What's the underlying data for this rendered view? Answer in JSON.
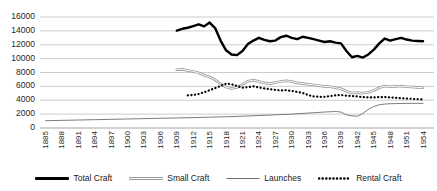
{
  "chart_data": {
    "type": "line",
    "title": "",
    "xlabel": "",
    "ylabel": "",
    "ylim": [
      0,
      16000
    ],
    "ytick_values": [
      0,
      2000,
      4000,
      6000,
      8000,
      10000,
      12000,
      14000,
      16000
    ],
    "ytick_labels": [
      "0",
      "2000",
      "4000",
      "6000",
      "8000",
      "10000",
      "12000",
      "14000",
      "16000"
    ],
    "grid": true,
    "legend_position": "bottom",
    "x_start": 1884,
    "x_end": 1956,
    "categories": [
      1885,
      1888,
      1891,
      1894,
      1897,
      1900,
      1903,
      1906,
      1909,
      1912,
      1915,
      1918,
      1921,
      1924,
      1927,
      1930,
      1933,
      1936,
      1939,
      1942,
      1945,
      1948,
      1951,
      1954
    ],
    "xtick_labels": [
      "1885",
      "1888",
      "1891",
      "1894",
      "1897",
      "1900",
      "1903",
      "1906",
      "1909",
      "1912",
      "1915",
      "1918",
      "1921",
      "1924",
      "1927",
      "1930",
      "1933",
      "1936",
      "1939",
      "1942",
      "1945",
      "1948",
      "1951",
      "1954"
    ],
    "series": [
      {
        "name": "Total Craft",
        "style": "thick-solid",
        "color": "#000000",
        "x": [
          1909,
          1910,
          1911,
          1912,
          1913,
          1914,
          1915,
          1916,
          1917,
          1918,
          1919,
          1920,
          1921,
          1922,
          1923,
          1924,
          1925,
          1926,
          1927,
          1928,
          1929,
          1930,
          1931,
          1932,
          1933,
          1934,
          1935,
          1936,
          1937,
          1938,
          1939,
          1940,
          1941,
          1942,
          1943,
          1944,
          1945,
          1946,
          1947,
          1948,
          1949,
          1950,
          1951,
          1952,
          1953,
          1954
        ],
        "values": [
          14050,
          14300,
          14450,
          14700,
          14950,
          14650,
          15200,
          14400,
          12600,
          11200,
          10600,
          10500,
          11100,
          12100,
          12600,
          13000,
          12700,
          12500,
          12600,
          13100,
          13300,
          13000,
          12800,
          13150,
          13000,
          12800,
          12600,
          12400,
          12500,
          12300,
          12200,
          11100,
          10200,
          10400,
          10150,
          10600,
          11300,
          12200,
          12900,
          12600,
          12800,
          13000,
          12750,
          12600,
          12550,
          12500
        ]
      },
      {
        "name": "Small Craft",
        "style": "double-solid",
        "color": "#8c8c8c",
        "x": [
          1909,
          1910,
          1911,
          1912,
          1913,
          1914,
          1915,
          1916,
          1917,
          1918,
          1919,
          1920,
          1921,
          1922,
          1923,
          1924,
          1925,
          1926,
          1927,
          1928,
          1929,
          1930,
          1931,
          1932,
          1933,
          1934,
          1935,
          1936,
          1937,
          1938,
          1939,
          1940,
          1941,
          1942,
          1943,
          1944,
          1945,
          1946,
          1947,
          1948,
          1949,
          1950,
          1951,
          1952,
          1953,
          1954
        ],
        "values": [
          8400,
          8450,
          8300,
          8150,
          7950,
          7600,
          7350,
          6950,
          6350,
          5900,
          5700,
          5850,
          6300,
          6750,
          6900,
          6700,
          6500,
          6400,
          6550,
          6700,
          6800,
          6700,
          6500,
          6400,
          6300,
          6200,
          6100,
          6000,
          5950,
          5800,
          5650,
          5300,
          5050,
          5100,
          5000,
          5150,
          5400,
          5800,
          6050,
          5950,
          6000,
          6050,
          5950,
          5900,
          5850,
          5800
        ]
      },
      {
        "name": "Launches",
        "style": "thin-solid",
        "color": "#6e6e6e",
        "x": [
          1885,
          1888,
          1891,
          1894,
          1897,
          1900,
          1903,
          1906,
          1909,
          1912,
          1915,
          1918,
          1921,
          1924,
          1927,
          1930,
          1933,
          1936,
          1938,
          1939,
          1940,
          1941,
          1942,
          1943,
          1944,
          1945,
          1946,
          1947,
          1948,
          1949,
          1950,
          1951,
          1952,
          1953,
          1954
        ],
        "values": [
          1050,
          1100,
          1150,
          1200,
          1250,
          1300,
          1350,
          1400,
          1450,
          1500,
          1560,
          1620,
          1700,
          1800,
          1900,
          2000,
          2150,
          2300,
          2380,
          2300,
          1900,
          1750,
          1700,
          2100,
          2700,
          3100,
          3350,
          3450,
          3500,
          3520,
          3530,
          3540,
          3550,
          3550,
          3550
        ]
      },
      {
        "name": "Rental Craft",
        "style": "dotted",
        "color": "#000000",
        "x": [
          1911,
          1912,
          1913,
          1914,
          1915,
          1916,
          1917,
          1918,
          1919,
          1920,
          1921,
          1922,
          1923,
          1924,
          1925,
          1926,
          1927,
          1928,
          1929,
          1930,
          1931,
          1932,
          1933,
          1934,
          1935,
          1936,
          1937,
          1938,
          1939,
          1940,
          1941,
          1942,
          1943,
          1944,
          1945,
          1946,
          1947,
          1948,
          1949,
          1950,
          1951,
          1952,
          1953,
          1954
        ],
        "values": [
          4700,
          4750,
          4900,
          5150,
          5450,
          5750,
          6050,
          6400,
          6300,
          6050,
          5800,
          5900,
          6000,
          5850,
          5700,
          5600,
          5500,
          5400,
          5450,
          5350,
          5200,
          5050,
          4750,
          4550,
          4500,
          4500,
          4600,
          4700,
          4750,
          4650,
          4600,
          4550,
          4450,
          4400,
          4400,
          4450,
          4450,
          4400,
          4350,
          4300,
          4250,
          4200,
          4150,
          4100
        ]
      }
    ]
  },
  "legend": {
    "items": [
      {
        "label": "Total Craft",
        "swatch": "thick-solid-swatch"
      },
      {
        "label": "Small Craft",
        "swatch": "double-solid-swatch"
      },
      {
        "label": "Launches",
        "swatch": "thin-solid-swatch"
      },
      {
        "label": "Rental Craft",
        "swatch": "dotted-swatch"
      }
    ]
  }
}
